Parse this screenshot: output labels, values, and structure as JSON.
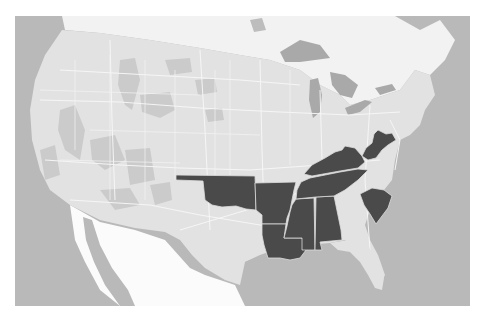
{
  "map": {
    "type": "choropleth",
    "region": "Contiguous United States",
    "style": "grayscale",
    "colors": {
      "ocean": "#b9b9b9",
      "us_land": "#e2e2e2",
      "canada_land": "#f2f2f2",
      "mexico_land": "#fbfbfb",
      "lakes": "#a9a9a9",
      "terrain_patches": "#c9c9c9",
      "roads": "#f7f7f7",
      "state_borders": "#f4f4f4",
      "highlight": "#4a4a4a",
      "background": "#ffffff"
    },
    "highlighted_states": [
      "Oklahoma",
      "Arkansas",
      "Louisiana",
      "Mississippi",
      "Alabama",
      "Tennessee",
      "Kentucky",
      "West Virginia",
      "South Carolina"
    ]
  }
}
